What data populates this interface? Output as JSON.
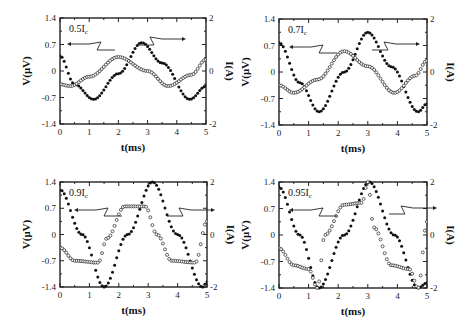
{
  "chart_data": [
    {
      "type": "line",
      "panel": "top-left",
      "label": "0.5I",
      "label_sub": "c",
      "xlabel": "t(ms)",
      "ylabel_left": "V(μV)",
      "ylabel_right": "I(A)",
      "xlim": [
        0,
        5
      ],
      "ylim_left": [
        -1.4,
        1.4
      ],
      "ylim_right": [
        -2,
        2
      ],
      "xticks": [
        "0",
        "1",
        "2",
        "3",
        "4",
        "5"
      ],
      "yticks_left": [
        "1.4",
        "0.7",
        "0",
        "-0.7",
        "-1.4"
      ],
      "yticks_right": [
        "2",
        "0",
        "-2"
      ],
      "series": [
        {
          "name": "I (filled circles, right axis)",
          "marker": "filled",
          "axis": "right",
          "x": [
            0,
            0.5,
            1.15,
            2.0,
            2.8,
            3.5,
            4.45,
            5.0
          ],
          "values": [
            0.57,
            -0.5,
            -1.07,
            -0.1,
            1.07,
            0.3,
            -1.07,
            -0.57
          ]
        },
        {
          "name": "V (open circles, left axis)",
          "marker": "open",
          "axis": "left",
          "x": [
            0,
            0.35,
            1.0,
            2.0,
            3.0,
            3.7,
            4.5,
            5.0
          ],
          "values": [
            -0.35,
            -0.4,
            -0.15,
            0.37,
            0.0,
            -0.4,
            -0.1,
            0.3
          ]
        }
      ]
    },
    {
      "type": "line",
      "panel": "top-right",
      "label": "0.7I",
      "label_sub": "c",
      "xlabel": "t(ms)",
      "ylabel_left": "V(μV)",
      "ylabel_right": "I(A)",
      "xlim": [
        0,
        5
      ],
      "ylim_left": [
        -1.4,
        1.4
      ],
      "ylim_right": [
        -2,
        2
      ],
      "xticks": [
        "0",
        "1",
        "2",
        "3",
        "4",
        "5"
      ],
      "yticks_left": [
        "1.4",
        "0.7",
        "0",
        "-0.7",
        "-1.4"
      ],
      "yticks_right": [
        "2",
        "0",
        "-2"
      ],
      "series": [
        {
          "name": "I (filled circles, right axis)",
          "marker": "filled",
          "axis": "right",
          "x": [
            0,
            0.7,
            1.35,
            2.2,
            3.0,
            3.8,
            4.7,
            5.0
          ],
          "values": [
            1.1,
            -0.4,
            -1.5,
            0.0,
            1.5,
            0.2,
            -1.5,
            -1.2
          ]
        },
        {
          "name": "V (open circles, left axis)",
          "marker": "open",
          "axis": "left",
          "x": [
            0,
            0.5,
            1.3,
            2.2,
            3.0,
            3.9,
            4.6,
            5.0
          ],
          "values": [
            -0.35,
            -0.55,
            -0.2,
            0.55,
            0.15,
            -0.55,
            -0.1,
            0.3
          ]
        }
      ]
    },
    {
      "type": "line",
      "panel": "bottom-left",
      "label": "0.9I",
      "label_sub": "c",
      "xlabel": "t(ms)",
      "ylabel_left": "V(μV)",
      "ylabel_right": "I(A)",
      "xlim": [
        0,
        5
      ],
      "ylim_left": [
        -1.4,
        1.4
      ],
      "ylim_right": [
        -2,
        2
      ],
      "xticks": [
        "0",
        "1",
        "2",
        "3",
        "4",
        "5"
      ],
      "yticks_left": [
        "1.4",
        "0.7",
        "0",
        "-0.7",
        "-1.4"
      ],
      "yticks_right": [
        "2",
        "0",
        "-2"
      ],
      "series": [
        {
          "name": "I (filled circles, right axis)",
          "marker": "filled",
          "axis": "right",
          "x": [
            0,
            0.75,
            1.5,
            2.3,
            3.15,
            4.0,
            4.85,
            5.0
          ],
          "values": [
            1.7,
            0.0,
            -2.0,
            0.0,
            2.0,
            0.0,
            -2.0,
            -1.8
          ]
        },
        {
          "name": "V (open circles, left axis)",
          "marker": "open",
          "axis": "left",
          "x": [
            0,
            0.5,
            1.3,
            1.6,
            2.2,
            2.9,
            3.3,
            3.8,
            4.6,
            5.0
          ],
          "values": [
            -0.35,
            -0.7,
            -0.75,
            -0.1,
            0.75,
            0.75,
            0.0,
            -0.7,
            -0.75,
            0.35
          ]
        }
      ]
    },
    {
      "type": "line",
      "panel": "bottom-right",
      "label": "0.95I",
      "label_sub": "c",
      "xlabel": "t(ms)",
      "ylabel_left": "V(μV)",
      "ylabel_right": "I(A)",
      "xlim": [
        0,
        5
      ],
      "ylim_left": [
        -1.4,
        1.4
      ],
      "ylim_right": [
        -2,
        2
      ],
      "xticks": [
        "0",
        "1",
        "2",
        "3",
        "4",
        "5"
      ],
      "yticks_left": [
        "1.4",
        "0.7",
        "0",
        "-0.7",
        "-1.4"
      ],
      "yticks_right": [
        "2",
        "0",
        "-2"
      ],
      "series": [
        {
          "name": "I (filled circles, right axis)",
          "marker": "filled",
          "axis": "right",
          "x": [
            0,
            0.7,
            1.35,
            2.2,
            3.05,
            3.9,
            4.7,
            5.0
          ],
          "values": [
            1.8,
            0.0,
            -2.0,
            0.0,
            2.0,
            0.0,
            -2.0,
            -1.8
          ]
        },
        {
          "name": "V (open circles, left axis)",
          "marker": "open",
          "axis": "left",
          "x": [
            0,
            0.5,
            1.0,
            1.3,
            1.55,
            2.2,
            2.8,
            3.0,
            3.2,
            3.8,
            4.4,
            4.7,
            5.0
          ],
          "values": [
            -0.35,
            -0.8,
            -0.9,
            -1.4,
            0.0,
            0.8,
            0.85,
            1.4,
            0.2,
            -0.8,
            -0.9,
            -1.4,
            0.35
          ]
        }
      ]
    }
  ],
  "panels": [
    {
      "frame": [
        60,
        18,
        206,
        124
      ],
      "label": "0.5I",
      "sub": "c"
    },
    {
      "frame": [
        279,
        19,
        427,
        125
      ],
      "label": "0.7I",
      "sub": "c"
    },
    {
      "frame": [
        60,
        182,
        207,
        287
      ],
      "label": "0.9I",
      "sub": "c"
    },
    {
      "frame": [
        279,
        182,
        427,
        288
      ],
      "label": "0.95I",
      "sub": "c"
    }
  ]
}
